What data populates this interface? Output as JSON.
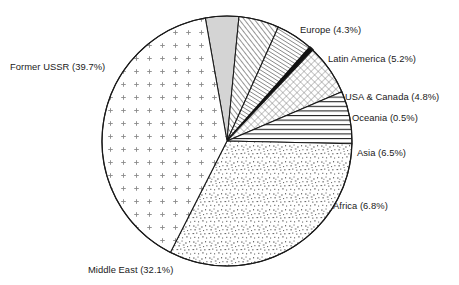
{
  "chart_data": {
    "type": "pie",
    "title": "",
    "subtitle": "",
    "xlabel": "",
    "ylabel": "",
    "legend_position": "none",
    "grid": false,
    "units": "percent",
    "start_angle_deg": -10,
    "direction": "clockwise",
    "categories": [
      "Europe",
      "Latin America",
      "USA & Canada",
      "Oceania",
      "Asia",
      "Africa",
      "Middle East",
      "Former USSR"
    ],
    "values": [
      4.3,
      5.2,
      4.8,
      0.5,
      6.5,
      6.8,
      32.1,
      39.7
    ],
    "slices": [
      {
        "name": "Europe",
        "value": 4.3,
        "label": "Europe (4.3%)",
        "pattern": "solid-light-gray",
        "fill": "#d4d4d4",
        "stroke": "#1a1a1a"
      },
      {
        "name": "Latin America",
        "value": 5.2,
        "label": "Latin America (5.2%)",
        "pattern": "diagonal-hatch-forward",
        "fill": "#ffffff",
        "stroke": "#1a1a1a"
      },
      {
        "name": "USA & Canada",
        "value": 4.8,
        "label": "USA & Canada (4.8%)",
        "pattern": "diagonal-hatch-forward-fine",
        "fill": "#ffffff",
        "stroke": "#1a1a1a"
      },
      {
        "name": "Oceania",
        "value": 0.5,
        "label": "Oceania (0.5%)",
        "pattern": "solid-black",
        "fill": "#111111",
        "stroke": "#111111"
      },
      {
        "name": "Asia",
        "value": 6.5,
        "label": "Asia (6.5%)",
        "pattern": "cross-hatch",
        "fill": "#ffffff",
        "stroke": "#1a1a1a"
      },
      {
        "name": "Africa",
        "value": 6.8,
        "label": "Africa (6.8%)",
        "pattern": "horizontal-lines",
        "fill": "#ffffff",
        "stroke": "#1a1a1a"
      },
      {
        "name": "Middle East",
        "value": 32.1,
        "label": "Middle East (32.1%)",
        "pattern": "dense-speckle",
        "fill": "#ffffff",
        "stroke": "#1a1a1a"
      },
      {
        "name": "Former USSR",
        "value": 39.7,
        "label": "Former USSR (39.7%)",
        "pattern": "sparse-plus-dots",
        "fill": "#ffffff",
        "stroke": "#1a1a1a"
      }
    ]
  },
  "labels": {
    "europe": "Europe (4.3%)",
    "latin_america": "Latin America (5.2%)",
    "usa_canada": "USA & Canada (4.8%)",
    "oceania": "Oceania (0.5%)",
    "asia": "Asia (6.5%)",
    "africa": "Africa (6.8%)",
    "middle_east": "Middle East (32.1%)",
    "former_ussr": "Former USSR (39.7%)"
  },
  "colors": {
    "outline": "#1a1a1a",
    "text": "#1a1a1a",
    "background": "#ffffff",
    "europe_fill": "#d4d4d4",
    "oceania_fill": "#111111"
  },
  "geometry": {
    "center_x": 227,
    "center_y": 141,
    "radius": 125
  }
}
